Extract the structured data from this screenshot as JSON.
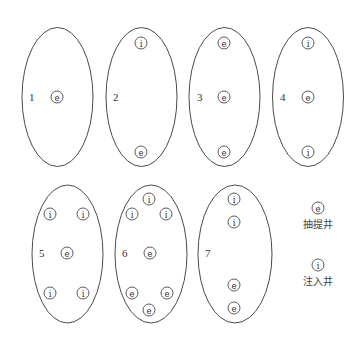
{
  "figure": {
    "type": "well-pattern diagram",
    "patterns": [
      {
        "id": "1",
        "label": "1",
        "cx": 57.5,
        "cy": 97,
        "rx": 35.5,
        "ry": 69.5,
        "label_pos": [
          29,
          97
        ],
        "wells": [
          {
            "type": "e",
            "x": 57,
            "y": 97
          }
        ]
      },
      {
        "id": "2",
        "label": "2",
        "cx": 141.5,
        "cy": 97,
        "rx": 35.5,
        "ry": 69.5,
        "label_pos": [
          113,
          97
        ],
        "wells": [
          {
            "type": "i",
            "x": 141,
            "y": 43
          },
          {
            "type": "e",
            "x": 141,
            "y": 152
          }
        ]
      },
      {
        "id": "3",
        "label": "3",
        "cx": 224.5,
        "cy": 97,
        "rx": 35.5,
        "ry": 69.5,
        "label_pos": [
          197,
          97
        ],
        "wells": [
          {
            "type": "e",
            "x": 224,
            "y": 43
          },
          {
            "type": "e",
            "x": 224,
            "y": 97
          },
          {
            "type": "e",
            "x": 224,
            "y": 152
          }
        ]
      },
      {
        "id": "4",
        "label": "4",
        "cx": 308,
        "cy": 97,
        "rx": 35.5,
        "ry": 69.5,
        "label_pos": [
          280,
          97
        ],
        "wells": [
          {
            "type": "i",
            "x": 308,
            "y": 43
          },
          {
            "type": "e",
            "x": 308,
            "y": 97
          },
          {
            "type": "i",
            "x": 308,
            "y": 152
          }
        ]
      },
      {
        "id": "5",
        "label": "5",
        "cx": 67.5,
        "cy": 254,
        "rx": 35.5,
        "ry": 69,
        "label_pos": [
          39,
          253
        ],
        "wells": [
          {
            "type": "i",
            "x": 50,
            "y": 214
          },
          {
            "type": "i",
            "x": 83,
            "y": 214
          },
          {
            "type": "e",
            "x": 67,
            "y": 253
          },
          {
            "type": "i",
            "x": 50,
            "y": 293
          },
          {
            "type": "i",
            "x": 83,
            "y": 293
          }
        ]
      },
      {
        "id": "6",
        "label": "6",
        "cx": 151,
        "cy": 254,
        "rx": 36,
        "ry": 69,
        "label_pos": [
          122,
          253
        ],
        "wells": [
          {
            "type": "i",
            "x": 149,
            "y": 199
          },
          {
            "type": "i",
            "x": 132,
            "y": 214
          },
          {
            "type": "i",
            "x": 166,
            "y": 214
          },
          {
            "type": "e",
            "x": 150,
            "y": 253
          },
          {
            "type": "e",
            "x": 132,
            "y": 293
          },
          {
            "type": "e",
            "x": 167,
            "y": 293
          },
          {
            "type": "e",
            "x": 149,
            "y": 310
          }
        ]
      },
      {
        "id": "7",
        "label": "7",
        "cx": 235,
        "cy": 254,
        "rx": 37,
        "ry": 69,
        "label_pos": [
          205,
          253
        ],
        "wells": [
          {
            "type": "i",
            "x": 234,
            "y": 199
          },
          {
            "type": "i",
            "x": 234,
            "y": 222
          },
          {
            "type": "e",
            "x": 234,
            "y": 285
          },
          {
            "type": "e",
            "x": 234,
            "y": 308
          }
        ]
      }
    ],
    "well_symbols": {
      "e": "e",
      "i": "i"
    },
    "legend": [
      {
        "symbol": "e",
        "text": "抽提井",
        "x": 318,
        "symbol_y": 208,
        "text_y": 224
      },
      {
        "symbol": "i",
        "text": "注入井",
        "x": 318,
        "symbol_y": 265,
        "text_y": 281
      }
    ],
    "colors": {
      "stroke": "#4a4a4a",
      "text": "#333333",
      "background": "#ffffff"
    }
  }
}
